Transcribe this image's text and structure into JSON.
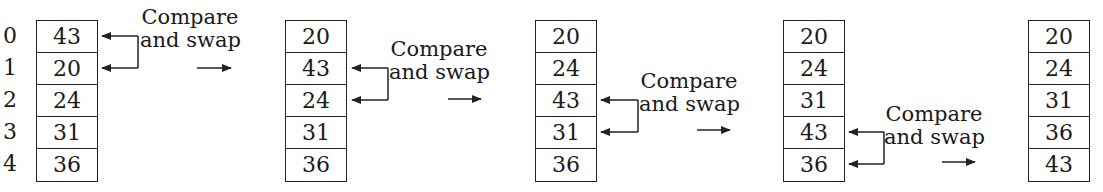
{
  "diagram": {
    "indices": [
      "0",
      "1",
      "2",
      "3",
      "4"
    ],
    "steps": [
      {
        "values": [
          "43",
          "20",
          "24",
          "31",
          "36"
        ],
        "swap_rows": [
          0,
          1
        ]
      },
      {
        "values": [
          "20",
          "43",
          "24",
          "31",
          "36"
        ],
        "swap_rows": [
          1,
          2
        ]
      },
      {
        "values": [
          "20",
          "24",
          "43",
          "31",
          "36"
        ],
        "swap_rows": [
          2,
          3
        ]
      },
      {
        "values": [
          "20",
          "24",
          "31",
          "43",
          "36"
        ],
        "swap_rows": [
          3,
          4
        ]
      },
      {
        "values": [
          "20",
          "24",
          "31",
          "36",
          "43"
        ],
        "swap_rows": null
      }
    ],
    "swap_label_line1": "Compare",
    "swap_label_line2": "and swap"
  }
}
